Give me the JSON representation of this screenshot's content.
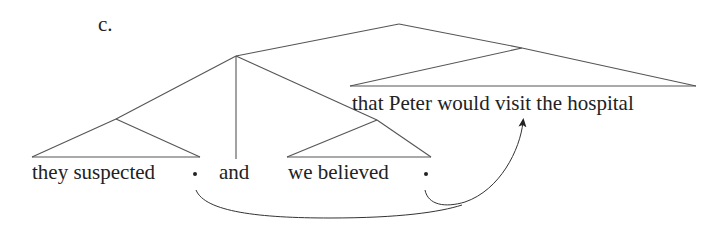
{
  "example_label": "c.",
  "leaves": {
    "left_conjunct": "they suspected",
    "conjunction": "and",
    "right_conjunct": "we believed",
    "shared_complement": "that Peter would visit the hospital"
  },
  "gap_markers": [
    {
      "after": "they suspected",
      "symbol": "•"
    },
    {
      "after": "we believed",
      "symbol": "•"
    }
  ],
  "arrow": {
    "from": [
      "gap after 'they suspected'",
      "gap after 'we believed'"
    ],
    "to": "that Peter would visit the hospital",
    "description": "curved arrows from both gaps merge and point to the extraposed shared complement"
  },
  "colors": {
    "line": "#555555",
    "text": "#222222",
    "background": "#ffffff"
  }
}
